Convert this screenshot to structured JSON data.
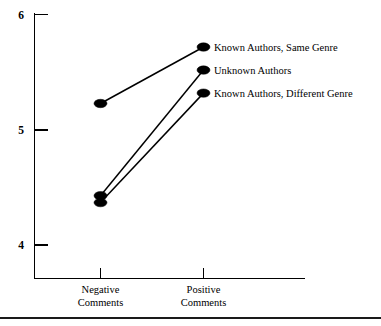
{
  "figure": {
    "name": "interaction-line-plot",
    "background_color": "#ffffff",
    "ink_color": "#000000"
  },
  "chart_data": {
    "type": "line",
    "title": "",
    "subtitle": "",
    "xlabel": "",
    "ylabel": "",
    "categories": [
      "Negative\nComments",
      "Positive\nComments"
    ],
    "category_labels": [
      {
        "line1": "Negative",
        "line2": "Comments"
      },
      {
        "line1": "Positive",
        "line2": "Comments"
      }
    ],
    "x": [
      1,
      2
    ],
    "ylim": [
      3.7,
      6.0
    ],
    "yticks": [
      4,
      5,
      6
    ],
    "ytick_labels": [
      "4",
      "5",
      "6"
    ],
    "grid": false,
    "legend_position": "inline-right-of-endpoints",
    "marker": "circle-filled",
    "series": [
      {
        "name": "Known Authors, Same Genre",
        "label": "Known Authors, Same Genre",
        "values": [
          5.23,
          5.72
        ],
        "color": "#000000"
      },
      {
        "name": "Unknown Authors",
        "label": "Unknown Authors",
        "values": [
          4.43,
          5.52
        ],
        "color": "#000000"
      },
      {
        "name": "Known Authors, Different Genre",
        "label": "Known Authors, Different Genre",
        "values": [
          4.37,
          5.32
        ],
        "color": "#000000"
      }
    ]
  },
  "annotations": {
    "bottom_rule": true
  }
}
